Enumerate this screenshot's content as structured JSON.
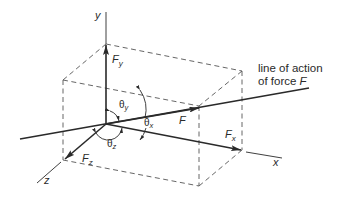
{
  "diagram": {
    "type": "3d-force-components",
    "axes": {
      "x": "x",
      "y": "y",
      "z": "z"
    },
    "force": {
      "label": "F"
    },
    "components": {
      "fx": "F",
      "fx_sub": "x",
      "fy": "F",
      "fy_sub": "y",
      "fz": "F",
      "fz_sub": "z"
    },
    "angles": {
      "theta_x": "θ",
      "theta_x_sub": "x",
      "theta_y": "θ",
      "theta_y_sub": "y",
      "theta_z": "θ",
      "theta_z_sub": "z"
    },
    "annotation": {
      "line1": "line of action",
      "line2": "of force ",
      "line2_italic": "F"
    },
    "colors": {
      "line": "#2a2a2a",
      "dashed": "#555555",
      "background": "#ffffff"
    }
  }
}
